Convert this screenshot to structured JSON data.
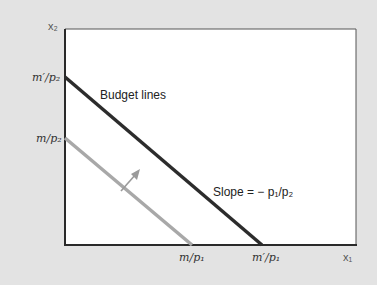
{
  "diagram": {
    "type": "budget-line-shift",
    "colors": {
      "background": "#e3e3e3",
      "plot_area": "#ffffff",
      "axis": "#2a2a2a",
      "new_budget_line": "#2c2c2c",
      "old_budget_line": "#a8a8a8",
      "arrow": "#9a9a9a"
    },
    "axes": {
      "x_label": "x₁",
      "y_label": "x₂"
    },
    "y_intercepts": {
      "new": "m′/p₂",
      "old": "m/p₂"
    },
    "x_intercepts": {
      "old": "m/p₁",
      "new": "m′/p₁"
    },
    "annotations": {
      "lines_label": "Budget lines",
      "slope_label": "Slope = − p₁/p₂"
    },
    "lines": [
      {
        "name": "old budget line",
        "from": "m/p₂",
        "to": "m/p₁",
        "style": "light gray"
      },
      {
        "name": "new budget line",
        "from": "m′/p₂",
        "to": "m′/p₁",
        "style": "dark"
      }
    ],
    "arrow": {
      "direction": "outward (up-right)",
      "meaning": "income increase shifts budget line out"
    }
  }
}
